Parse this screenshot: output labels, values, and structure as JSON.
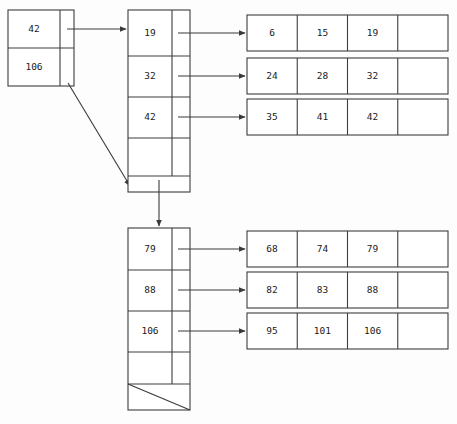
{
  "diagram": {
    "type": "b-plus-tree",
    "background_color": "#fdfdfd",
    "line_color": "#3d3d3d",
    "text_color": "#1a1a1a",
    "empty_cell_label": ""
  },
  "root_node": {
    "name": "root",
    "keys": [
      "42",
      "106"
    ],
    "slots": 2
  },
  "internal_nodes": [
    {
      "name": "internal-node-left",
      "keys": [
        "19",
        "32",
        "42"
      ],
      "empty_slots": 1,
      "tail_kind": "pointer-down",
      "tail_label": ""
    },
    {
      "name": "internal-node-right",
      "keys": [
        "79",
        "88",
        "106"
      ],
      "empty_slots": 1,
      "tail_kind": "null-slash",
      "tail_label": ""
    }
  ],
  "leaf_nodes": [
    {
      "name": "leaf-1",
      "values": [
        "6",
        "15",
        "19",
        ""
      ]
    },
    {
      "name": "leaf-2",
      "values": [
        "24",
        "28",
        "32",
        ""
      ]
    },
    {
      "name": "leaf-3",
      "values": [
        "35",
        "41",
        "42",
        ""
      ]
    },
    {
      "name": "leaf-4",
      "values": [
        "68",
        "74",
        "79",
        ""
      ]
    },
    {
      "name": "leaf-5",
      "values": [
        "82",
        "83",
        "88",
        ""
      ]
    },
    {
      "name": "leaf-6",
      "values": [
        "95",
        "101",
        "106",
        ""
      ]
    }
  ]
}
